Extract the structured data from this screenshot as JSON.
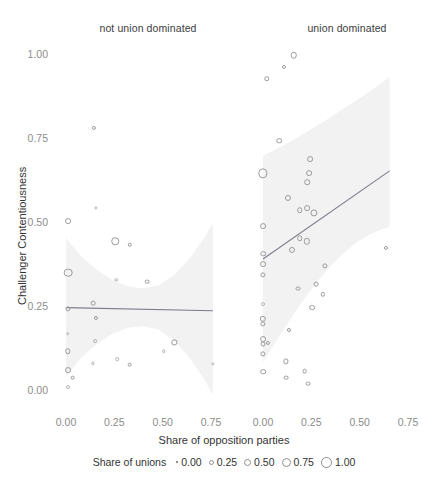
{
  "chart_data": {
    "type": "scatter",
    "title": "",
    "xlabel": "Share of opposition parties",
    "ylabel": "Challenger Contentiousness",
    "xlim": [
      -0.06,
      0.82
    ],
    "ylim": [
      -0.04,
      1.05
    ],
    "grid": false,
    "facet_variable": "union dominance",
    "legend": {
      "title": "Share of unions",
      "position": "bottom",
      "entries": [
        "0.00",
        "0.25",
        "0.50",
        "0.75",
        "1.00"
      ],
      "sizes_px": [
        2,
        5,
        7,
        9,
        11
      ]
    },
    "y_ticks": [
      "0.00",
      "0.25",
      "0.50",
      "0.75",
      "1.00"
    ],
    "y_tick_values": [
      0.0,
      0.25,
      0.5,
      0.75,
      1.0
    ],
    "x_ticks": [
      "0.00",
      "0.25",
      "0.50",
      "0.75"
    ],
    "x_tick_values": [
      0.0,
      0.25,
      0.5,
      0.75
    ],
    "panels": [
      {
        "label": "not union dominated",
        "fit": {
          "x0": 0.0,
          "y0": 0.248,
          "x1": 0.76,
          "y1": 0.239
        },
        "ribbon_upper": [
          [
            0.0,
            0.455
          ],
          [
            0.08,
            0.4
          ],
          [
            0.16,
            0.36
          ],
          [
            0.24,
            0.33
          ],
          [
            0.32,
            0.312
          ],
          [
            0.4,
            0.305
          ],
          [
            0.48,
            0.315
          ],
          [
            0.56,
            0.345
          ],
          [
            0.64,
            0.395
          ],
          [
            0.72,
            0.46
          ],
          [
            0.76,
            0.5
          ]
        ],
        "ribbon_lower": [
          [
            0.0,
            0.045
          ],
          [
            0.08,
            0.1
          ],
          [
            0.16,
            0.14
          ],
          [
            0.24,
            0.17
          ],
          [
            0.32,
            0.188
          ],
          [
            0.4,
            0.193
          ],
          [
            0.48,
            0.182
          ],
          [
            0.56,
            0.15
          ],
          [
            0.64,
            0.098
          ],
          [
            0.72,
            0.03
          ],
          [
            0.76,
            -0.012
          ]
        ],
        "points": [
          {
            "x": 0.145,
            "y": 0.783,
            "size": 0.18
          },
          {
            "x": 0.155,
            "y": 0.545,
            "size": 0.12
          },
          {
            "x": 0.01,
            "y": 0.505,
            "size": 0.3
          },
          {
            "x": 0.255,
            "y": 0.445,
            "size": 0.42
          },
          {
            "x": 0.33,
            "y": 0.435,
            "size": 0.2
          },
          {
            "x": 0.01,
            "y": 0.352,
            "size": 0.5
          },
          {
            "x": 0.26,
            "y": 0.33,
            "size": 0.12
          },
          {
            "x": 0.42,
            "y": 0.325,
            "size": 0.22
          },
          {
            "x": 0.01,
            "y": 0.245,
            "size": 0.26
          },
          {
            "x": 0.14,
            "y": 0.262,
            "size": 0.22
          },
          {
            "x": 0.155,
            "y": 0.218,
            "size": 0.18
          },
          {
            "x": 0.01,
            "y": 0.17,
            "size": 0.14
          },
          {
            "x": 0.15,
            "y": 0.148,
            "size": 0.16
          },
          {
            "x": 0.01,
            "y": 0.118,
            "size": 0.28
          },
          {
            "x": 0.56,
            "y": 0.145,
            "size": 0.26
          },
          {
            "x": 0.505,
            "y": 0.118,
            "size": 0.14
          },
          {
            "x": 0.265,
            "y": 0.095,
            "size": 0.14
          },
          {
            "x": 0.33,
            "y": 0.078,
            "size": 0.22
          },
          {
            "x": 0.14,
            "y": 0.082,
            "size": 0.12
          },
          {
            "x": 0.01,
            "y": 0.062,
            "size": 0.3
          },
          {
            "x": 0.035,
            "y": 0.04,
            "size": 0.22
          },
          {
            "x": 0.01,
            "y": 0.012,
            "size": 0.16
          },
          {
            "x": 0.76,
            "y": 0.08,
            "size": 0.12
          }
        ]
      },
      {
        "label": "union dominated",
        "fit": {
          "x0": 0.0,
          "y0": 0.393,
          "x1": 0.655,
          "y1": 0.655
        },
        "ribbon_upper": [
          [
            0.0,
            0.7
          ],
          [
            0.07,
            0.72
          ],
          [
            0.14,
            0.742
          ],
          [
            0.21,
            0.765
          ],
          [
            0.28,
            0.79
          ],
          [
            0.35,
            0.815
          ],
          [
            0.42,
            0.842
          ],
          [
            0.49,
            0.868
          ],
          [
            0.56,
            0.895
          ],
          [
            0.62,
            0.92
          ],
          [
            0.655,
            0.935
          ]
        ],
        "ribbon_lower": [
          [
            0.0,
            0.085
          ],
          [
            0.07,
            0.15
          ],
          [
            0.14,
            0.212
          ],
          [
            0.21,
            0.272
          ],
          [
            0.28,
            0.325
          ],
          [
            0.35,
            0.372
          ],
          [
            0.42,
            0.412
          ],
          [
            0.49,
            0.445
          ],
          [
            0.56,
            0.468
          ],
          [
            0.62,
            0.482
          ],
          [
            0.655,
            0.488
          ]
        ],
        "points": [
          {
            "x": 0.16,
            "y": 1.0,
            "size": 0.35
          },
          {
            "x": 0.11,
            "y": 0.965,
            "size": 0.18
          },
          {
            "x": 0.02,
            "y": 0.93,
            "size": 0.28
          },
          {
            "x": 0.085,
            "y": 0.745,
            "size": 0.28
          },
          {
            "x": 0.245,
            "y": 0.69,
            "size": 0.3
          },
          {
            "x": 0.24,
            "y": 0.648,
            "size": 0.3
          },
          {
            "x": 0.228,
            "y": 0.622,
            "size": 0.28
          },
          {
            "x": 0.0,
            "y": 0.648,
            "size": 0.55
          },
          {
            "x": 0.13,
            "y": 0.575,
            "size": 0.32
          },
          {
            "x": 0.23,
            "y": 0.545,
            "size": 0.3
          },
          {
            "x": 0.19,
            "y": 0.538,
            "size": 0.28
          },
          {
            "x": 0.265,
            "y": 0.53,
            "size": 0.4
          },
          {
            "x": 0.19,
            "y": 0.455,
            "size": 0.28
          },
          {
            "x": 0.228,
            "y": 0.445,
            "size": 0.34
          },
          {
            "x": 0.148,
            "y": 0.42,
            "size": 0.32
          },
          {
            "x": 0.0,
            "y": 0.49,
            "size": 0.3
          },
          {
            "x": 0.0,
            "y": 0.408,
            "size": 0.28
          },
          {
            "x": 0.0,
            "y": 0.378,
            "size": 0.3
          },
          {
            "x": 0.0,
            "y": 0.345,
            "size": 0.26
          },
          {
            "x": 0.32,
            "y": 0.372,
            "size": 0.26
          },
          {
            "x": 0.18,
            "y": 0.305,
            "size": 0.24
          },
          {
            "x": 0.275,
            "y": 0.318,
            "size": 0.22
          },
          {
            "x": 0.31,
            "y": 0.288,
            "size": 0.2
          },
          {
            "x": 0.0,
            "y": 0.258,
            "size": 0.16
          },
          {
            "x": 0.255,
            "y": 0.248,
            "size": 0.3
          },
          {
            "x": 0.0,
            "y": 0.215,
            "size": 0.34
          },
          {
            "x": 0.0,
            "y": 0.2,
            "size": 0.26
          },
          {
            "x": 0.135,
            "y": 0.182,
            "size": 0.18
          },
          {
            "x": 0.0,
            "y": 0.155,
            "size": 0.3
          },
          {
            "x": 0.0,
            "y": 0.14,
            "size": 0.24
          },
          {
            "x": 0.025,
            "y": 0.142,
            "size": 0.18
          },
          {
            "x": 0.0,
            "y": 0.11,
            "size": 0.26
          },
          {
            "x": 0.0,
            "y": 0.058,
            "size": 0.28
          },
          {
            "x": 0.635,
            "y": 0.425,
            "size": 0.18
          },
          {
            "x": 0.118,
            "y": 0.088,
            "size": 0.26
          },
          {
            "x": 0.12,
            "y": 0.04,
            "size": 0.22
          },
          {
            "x": 0.215,
            "y": 0.06,
            "size": 0.22
          },
          {
            "x": 0.235,
            "y": 0.022,
            "size": 0.22
          }
        ]
      }
    ]
  },
  "colors": {
    "ribbon": "#f0f0f0",
    "fit_line": "#7d7d8c",
    "point_stroke": "#9a9a9a",
    "tick_text": "#8c8c8c",
    "title_text": "#333333",
    "background": "#ffffff"
  }
}
